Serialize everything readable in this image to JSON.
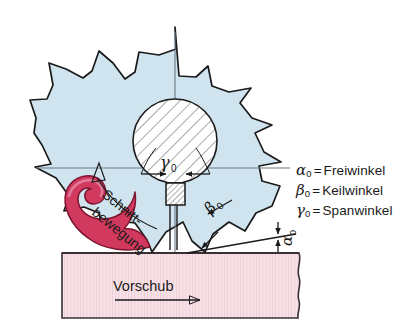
{
  "figure": {
    "background_color": "#ffffff"
  },
  "colors": {
    "blade_fill": "#cfe4ee",
    "blade_stroke": "#1a1a1a",
    "workpiece_fill": "#f5dde3",
    "workpiece_hatch": "#e9c3ce",
    "workpiece_stroke": "#3a3030",
    "chip_fill": "#d13a5e",
    "chip_highlight": "#e3799a",
    "chip_stroke": "#7d1430",
    "hub_fill": "#ffffff",
    "hub_hatch": "#555555",
    "centerline": "#6b7b86",
    "text": "#1a1a1a"
  },
  "labels": {
    "gamma_zero": {
      "symbol": "γ",
      "subscript": "0",
      "name": "rake-angle-label"
    },
    "beta_zero": {
      "symbol": "β",
      "subscript": "0",
      "name": "wedge-angle-label"
    },
    "alpha_zero": {
      "symbol": "α",
      "subscript": "0",
      "name": "clearance-angle-label"
    },
    "cutting_motion_line1": "Schnitt-",
    "cutting_motion_line2": "bewegung",
    "feed": "Vorschub"
  },
  "legend": {
    "rows": [
      {
        "symbol": "α",
        "subscript": "0",
        "equals": "=",
        "term": "Freiwinkel"
      },
      {
        "symbol": "β",
        "subscript": "0",
        "equals": "=",
        "term": "Keilwinkel"
      },
      {
        "symbol": "γ",
        "subscript": "0",
        "equals": "=",
        "term": "Spanwinkel"
      }
    ]
  }
}
